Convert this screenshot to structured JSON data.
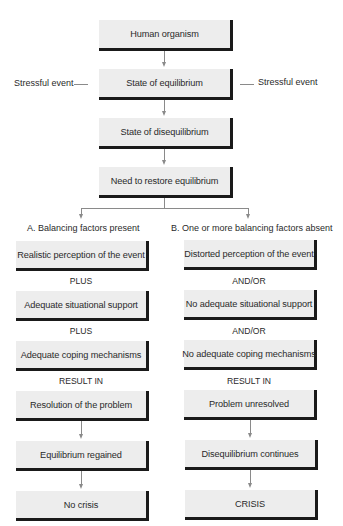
{
  "diagram": {
    "type": "flowchart",
    "title": "",
    "trunk": [
      {
        "id": "human-organism",
        "label": "Human organism"
      },
      {
        "id": "state-of-equilibrium",
        "label": "State of equilibrium"
      },
      {
        "id": "state-of-disequilibrium",
        "label": "State of disequilibrium"
      },
      {
        "id": "need-to-restore",
        "label": "Need to restore equilibrium"
      }
    ],
    "side_inputs": {
      "left": "Stressful event",
      "right": "Stressful event"
    },
    "branches": {
      "a": {
        "heading": "A. Balancing factors present",
        "factors": [
          "Realistic perception of the event",
          "Adequate situational support",
          "Adequate coping mechanisms"
        ],
        "connector": "PLUS",
        "result_label": "RESULT IN",
        "outcomes": [
          "Resolution of the problem",
          "Equilibrium regained",
          "No crisis"
        ]
      },
      "b": {
        "heading": "B. One or more balancing factors absent",
        "factors": [
          "Distorted perception of the event",
          "No adequate situational support",
          "No adequate coping mechanisms"
        ],
        "connector": "AND/OR",
        "result_label": "RESULT IN",
        "outcomes": [
          "Problem unresolved",
          "Disequilibrium continues",
          "CRISIS"
        ]
      }
    },
    "colors": {
      "box_fill": "#ededed",
      "box_shadow": "#1a1a1a",
      "connector_line": "#8a8a8a",
      "text": "#2a2a2a"
    }
  }
}
